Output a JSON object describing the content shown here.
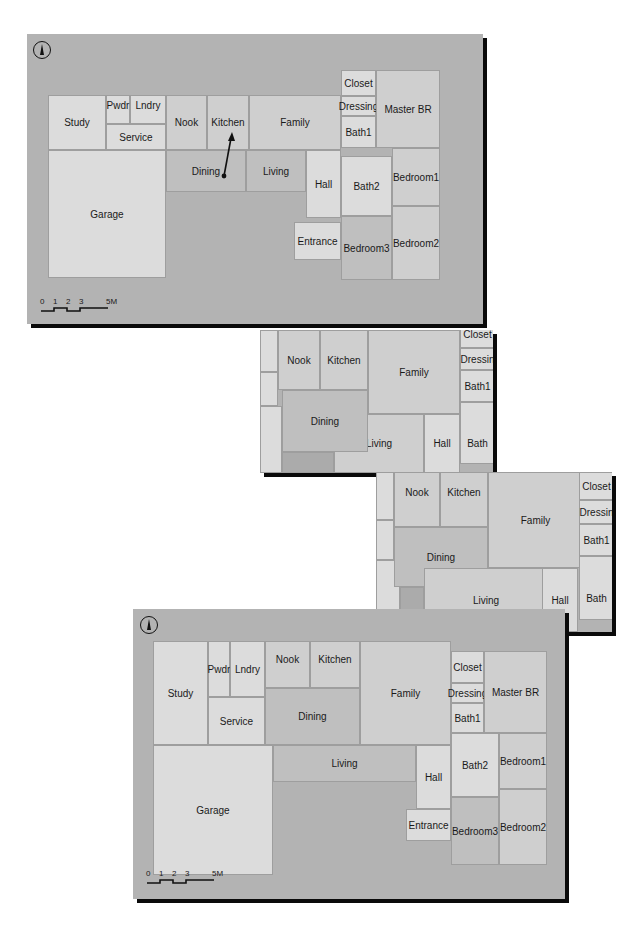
{
  "figure": {
    "panels": [
      {
        "id": "panel-1",
        "description": "Full floor plan with arrow from Dining to Kitchen",
        "north_icon": "north-arrow-icon",
        "scale_bar": {
          "ticks": [
            "0",
            "1",
            "2",
            "3",
            "5M"
          ]
        },
        "rooms": {
          "study": "Study",
          "pwdr": "Pwdr",
          "lndry": "Lndry",
          "service": "Service",
          "nook": "Nook",
          "kitchen": "Kitchen",
          "family": "Family",
          "closet": "Closet",
          "dressing": "Dressing",
          "bath1": "Bath1",
          "master_br": "Master BR",
          "garage": "Garage",
          "dining": "Dining",
          "living": "Living",
          "hall": "Hall",
          "bath2": "Bath2",
          "bedroom1": "Bedroom1",
          "entrance": "Entrance",
          "bedroom3": "Bedroom3",
          "bedroom2": "Bedroom2"
        }
      },
      {
        "id": "panel-2",
        "description": "Intermediate zoomed view (Dining moved)",
        "rooms": {
          "nook": "Nook",
          "kitchen": "Kitchen",
          "family": "Family",
          "closet": "Closet",
          "dressing": "Dressin",
          "bath1": "Bath1",
          "dining": "Dining",
          "living": "Living",
          "hall": "Hall",
          "bath2": "Bath"
        }
      },
      {
        "id": "panel-3",
        "description": "Further intermediate zoomed view",
        "rooms": {
          "nook": "Nook",
          "kitchen": "Kitchen",
          "family": "Family",
          "closet": "Closet",
          "dressing": "Dressin",
          "bath1": "Bath1",
          "dining": "Dining",
          "living": "Living",
          "hall": "Hall",
          "bath2": "Bath"
        }
      },
      {
        "id": "panel-4",
        "description": "Resulting floor plan after moving Dining",
        "north_icon": "north-arrow-icon",
        "scale_bar": {
          "ticks": [
            "0",
            "1",
            "2",
            "3",
            "5M"
          ]
        },
        "rooms": {
          "study": "Study",
          "pwdr": "Pwdr",
          "lndry": "Lndry",
          "service": "Service",
          "nook": "Nook",
          "kitchen": "Kitchen",
          "family": "Family",
          "dining": "Dining",
          "closet": "Closet",
          "dressing": "Dressing",
          "bath1": "Bath1",
          "master_br": "Master BR",
          "garage": "Garage",
          "living": "Living",
          "hall": "Hall",
          "bath2": "Bath2",
          "bedroom1": "Bedroom1",
          "entrance": "Entrance",
          "bedroom3": "Bedroom3",
          "bedroom2": "Bedroom2"
        }
      }
    ],
    "caption_visible": ""
  }
}
